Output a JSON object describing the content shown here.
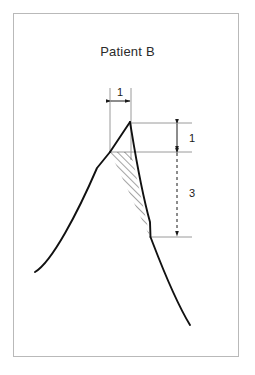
{
  "figure": {
    "title": "Patient B",
    "type": "annotated-waveform-diagram",
    "frame": {
      "x": 13,
      "y": 13,
      "width": 226,
      "height": 344,
      "border_color": "#b9b9b9"
    },
    "colors": {
      "curve": "#111111",
      "reference_line": "#9a9a9a",
      "dimension_line": "#1a1a1a",
      "hatch": "#1a1a1a",
      "frame": "#b9b9b9",
      "title_text": "#2b2b2b",
      "background": "#ffffff"
    },
    "annotations": [
      {
        "name": "width-dimension",
        "label": "1",
        "orientation": "horizontal",
        "style": "solid",
        "label_x": 120,
        "label_y": 93,
        "x1": 110,
        "x2": 131,
        "y": 101
      },
      {
        "name": "upper-height-dimension",
        "label": "1",
        "orientation": "vertical",
        "style": "solid",
        "label_x": 192,
        "label_y": 142,
        "x": 177,
        "y1": 123,
        "y2": 152
      },
      {
        "name": "lower-height-dimension",
        "label": "3",
        "orientation": "vertical",
        "style": "dashed",
        "label_x": 192,
        "label_y": 197,
        "x": 177,
        "y1": 152,
        "y2": 237
      }
    ],
    "reference_lines": [
      {
        "name": "left-vertical-reference",
        "x1": 110,
        "y1": 88,
        "x2": 110,
        "y2": 152
      },
      {
        "name": "right-vertical-reference",
        "x1": 131,
        "y1": 88,
        "x2": 131,
        "y2": 160
      },
      {
        "name": "peak-horizontal-reference",
        "x1": 130,
        "y1": 123,
        "x2": 192,
        "y2": 123
      },
      {
        "name": "shoulder-horizontal-reference",
        "x1": 110,
        "y1": 152,
        "x2": 192,
        "y2": 152
      },
      {
        "name": "trough-horizontal-reference",
        "x1": 150,
        "y1": 237,
        "x2": 192,
        "y2": 237
      }
    ],
    "curve": {
      "name": "patient-waveform",
      "ascending_path": "M 35,272 C 52,262 78,212 97,168 L 110,152",
      "peak_path": "M 110,152 L 130,122",
      "descending_path": "M 130,122 C 134,146 140,186 150,222 L 150,237 C 158,258 172,296 190,325",
      "points": {
        "start": [
          35,
          272
        ],
        "shoulder": [
          110,
          152
        ],
        "peak": [
          130,
          122
        ],
        "trough": [
          150,
          237
        ],
        "end": [
          190,
          325
        ]
      }
    },
    "hatched_region": {
      "name": "shaded-area",
      "vertices": [
        [
          110,
          152
        ],
        [
          131,
          152
        ],
        [
          150,
          237
        ]
      ],
      "pattern": "diagonal-hatch",
      "hatch_angle_deg": 45
    }
  }
}
